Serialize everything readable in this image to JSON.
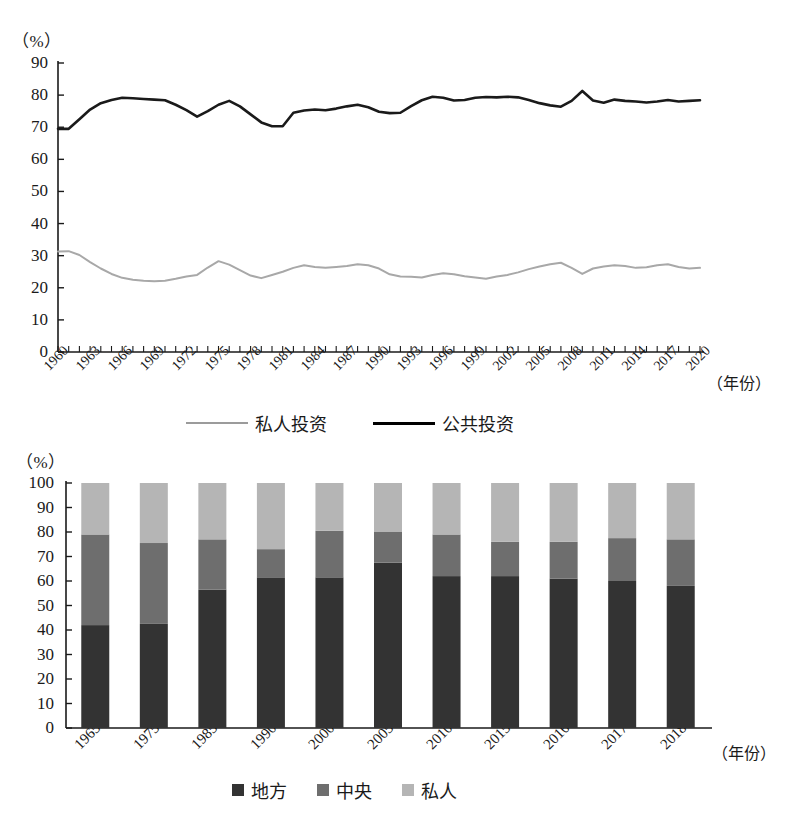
{
  "chart_data": [
    {
      "type": "line",
      "title": "",
      "unit_label": "（%）",
      "xlabel": "（年份）",
      "ylabel": "",
      "ylim": [
        0,
        90
      ],
      "yticks": [
        0,
        10,
        20,
        30,
        40,
        50,
        60,
        70,
        80,
        90
      ],
      "xlim": [
        1960,
        2020
      ],
      "xticks": [
        "1960",
        "1963",
        "1966",
        "1969",
        "1972",
        "1975",
        "1978",
        "1981",
        "1984",
        "1987",
        "1990",
        "1993",
        "1996",
        "1999",
        "2002",
        "2005",
        "2008",
        "2011",
        "2014",
        "2017",
        "2020"
      ],
      "grid": false,
      "legend_position": "bottom",
      "x": [
        1960,
        1961,
        1962,
        1963,
        1964,
        1965,
        1966,
        1967,
        1968,
        1969,
        1970,
        1971,
        1972,
        1973,
        1974,
        1975,
        1976,
        1977,
        1978,
        1979,
        1980,
        1981,
        1982,
        1983,
        1984,
        1985,
        1986,
        1987,
        1988,
        1989,
        1990,
        1991,
        1992,
        1993,
        1994,
        1995,
        1996,
        1997,
        1998,
        1999,
        2000,
        2001,
        2002,
        2003,
        2004,
        2005,
        2006,
        2007,
        2008,
        2009,
        2010,
        2011,
        2012,
        2013,
        2014,
        2015,
        2016,
        2017,
        2018,
        2019,
        2020
      ],
      "series": [
        {
          "name": "公共投资",
          "color": "#1a1a1a",
          "width": 2.6,
          "values": [
            69.5,
            69.5,
            72.5,
            75.5,
            77.5,
            78.5,
            79.2,
            79.0,
            78.8,
            78.6,
            78.4,
            77.0,
            75.3,
            73.3,
            75.0,
            77.0,
            78.2,
            76.5,
            74.0,
            71.5,
            70.3,
            70.3,
            74.5,
            75.2,
            75.5,
            75.3,
            75.8,
            76.5,
            77.0,
            76.2,
            74.8,
            74.4,
            74.5,
            76.6,
            78.4,
            79.5,
            79.2,
            78.3,
            78.5,
            79.2,
            79.4,
            79.3,
            79.5,
            79.3,
            78.5,
            77.5,
            76.8,
            76.4,
            78.2,
            81.3,
            78.3,
            77.6,
            78.6,
            78.2,
            78.0,
            77.7,
            78.0,
            78.5,
            78.0,
            78.2,
            78.4
          ]
        },
        {
          "name": "私人投资",
          "color": "#a8a8a8",
          "width": 2.0,
          "values": [
            31.3,
            31.4,
            30.2,
            28.0,
            26.0,
            24.3,
            23.1,
            22.5,
            22.2,
            22.0,
            22.2,
            22.8,
            23.5,
            24.0,
            26.3,
            28.3,
            27.2,
            25.5,
            23.8,
            23.0,
            24.0,
            25.0,
            26.2,
            27.0,
            26.5,
            26.2,
            26.5,
            26.8,
            27.3,
            27.0,
            26.0,
            24.2,
            23.5,
            23.4,
            23.2,
            24.0,
            24.5,
            24.2,
            23.6,
            23.2,
            22.8,
            23.5,
            24.0,
            24.8,
            25.8,
            26.6,
            27.3,
            27.8,
            26.2,
            24.3,
            26.0,
            26.6,
            27.0,
            26.8,
            26.2,
            26.4,
            27.0,
            27.3,
            26.5,
            26.0,
            26.2
          ]
        }
      ]
    },
    {
      "type": "bar",
      "subtype": "stacked",
      "title": "",
      "unit_label": "（%）",
      "xlabel": "（年份）",
      "ylabel": "",
      "ylim": [
        0,
        100
      ],
      "yticks": [
        0,
        10,
        20,
        30,
        40,
        50,
        60,
        70,
        80,
        90,
        100
      ],
      "grid": false,
      "legend_position": "bottom",
      "categories": [
        "1965",
        "1975",
        "1985",
        "1990",
        "2000",
        "2005",
        "2010",
        "2015",
        "2016",
        "2017",
        "2018"
      ],
      "series": [
        {
          "name": "地方",
          "color": "#333333",
          "values": [
            42,
            42.5,
            56.5,
            61.5,
            61.5,
            67.5,
            62,
            62,
            61,
            60,
            58
          ]
        },
        {
          "name": "中央",
          "color": "#6e6e6e",
          "values": [
            37,
            33,
            20.5,
            11.5,
            19,
            12.5,
            17,
            14,
            15,
            17.5,
            19
          ]
        },
        {
          "name": "私人",
          "color": "#b5b5b5",
          "values": [
            21,
            24.5,
            23,
            27,
            19.5,
            20,
            21,
            24,
            24,
            22.5,
            23
          ]
        }
      ]
    }
  ],
  "top_chart": {
    "unit_label": "（%）",
    "xaxis_name": "（年份）",
    "yticks": [
      "90",
      "80",
      "70",
      "60",
      "50",
      "40",
      "30",
      "20",
      "10",
      "0"
    ],
    "xticks": [
      "1960",
      "1963",
      "1966",
      "1969",
      "1972",
      "1975",
      "1978",
      "1981",
      "1984",
      "1987",
      "1990",
      "1993",
      "1996",
      "1999",
      "2002",
      "2005",
      "2008",
      "2011",
      "2014",
      "2017",
      "2020"
    ],
    "legend": [
      {
        "label": "私人投资",
        "style": "thin-gray-line"
      },
      {
        "label": "公共投资",
        "style": "thick-black-line"
      }
    ]
  },
  "bottom_chart": {
    "unit_label": "（%）",
    "xaxis_name": "（年份）",
    "yticks": [
      "100",
      "90",
      "80",
      "70",
      "60",
      "50",
      "40",
      "30",
      "20",
      "10",
      "0"
    ],
    "xticks": [
      "1965",
      "1975",
      "1985",
      "1990",
      "2000",
      "2005",
      "2010",
      "2015",
      "2016",
      "2017",
      "2018"
    ],
    "legend": [
      {
        "label": "地方",
        "swatch": "#333333"
      },
      {
        "label": "中央",
        "swatch": "#6e6e6e"
      },
      {
        "label": "私人",
        "swatch": "#b5b5b5"
      }
    ]
  },
  "colors": {
    "public_line": "#1a1a1a",
    "private_line": "#a8a8a8",
    "local": "#333333",
    "central": "#6e6e6e",
    "private": "#b5b5b5",
    "axis": "#1a1a1a"
  }
}
